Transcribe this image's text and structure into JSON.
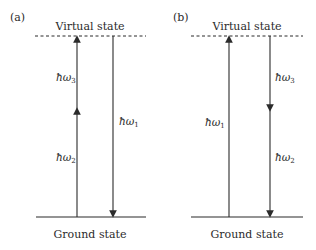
{
  "diagram": {
    "type": "energy-level-diagram",
    "panels": [
      {
        "label": "(a)",
        "top_level": "Virtual state",
        "bottom_level": "Ground state",
        "transitions": [
          {
            "symbol": "ħω",
            "subscript": "3",
            "direction": "up",
            "segment": "upper"
          },
          {
            "symbol": "ħω",
            "subscript": "2",
            "direction": "up",
            "segment": "lower"
          },
          {
            "symbol": "ħω",
            "subscript": "1",
            "direction": "down",
            "segment": "full"
          }
        ]
      },
      {
        "label": "(b)",
        "top_level": "Virtual state",
        "bottom_level": "Ground state",
        "transitions": [
          {
            "symbol": "ħω",
            "subscript": "1",
            "direction": "up",
            "segment": "full"
          },
          {
            "symbol": "ħω",
            "subscript": "3",
            "direction": "down",
            "segment": "upper"
          },
          {
            "symbol": "ħω",
            "subscript": "2",
            "direction": "down",
            "segment": "lower"
          }
        ]
      }
    ],
    "colors": {
      "line": "#2b2b2b",
      "background": "#ffffff"
    }
  }
}
